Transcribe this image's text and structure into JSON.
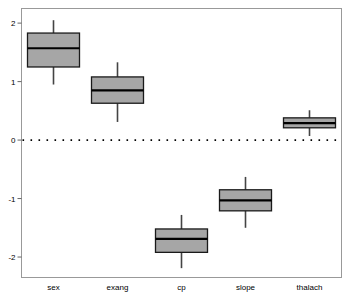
{
  "chart_data": {
    "type": "boxplot",
    "title": "",
    "subtitle": "",
    "xlabel": "",
    "ylabel": "",
    "categories": [
      "sex",
      "exang",
      "cp",
      "slope",
      "thalach"
    ],
    "ylim": [
      -2.35,
      2.25
    ],
    "yticks": [
      2,
      1,
      0,
      -1,
      -2
    ],
    "ytick_labels": [
      "2",
      "1",
      "0",
      "-1",
      "-2"
    ],
    "grid": false,
    "legend": "none",
    "reference_line": {
      "value": 0,
      "style": "dotted",
      "color": "#000000",
      "label": "0"
    },
    "box_fill": "#a6a6a6",
    "box_stroke": "#1a1a1a",
    "frame_color": "#999999",
    "boxes": [
      {
        "name": "sex",
        "whisker_low": 0.95,
        "q1": 1.25,
        "median": 1.57,
        "q3": 1.83,
        "whisker_high": 2.05
      },
      {
        "name": "exang",
        "whisker_low": 0.31,
        "q1": 0.63,
        "median": 0.85,
        "q3": 1.08,
        "whisker_high": 1.33
      },
      {
        "name": "cp",
        "whisker_low": -2.19,
        "q1": -1.92,
        "median": -1.69,
        "q3": -1.52,
        "whisker_high": -1.28
      },
      {
        "name": "slope",
        "whisker_low": -1.5,
        "q1": -1.21,
        "median": -1.03,
        "q3": -0.85,
        "whisker_high": -0.63
      },
      {
        "name": "thalach",
        "whisker_low": 0.07,
        "q1": 0.21,
        "median": 0.29,
        "q3": 0.38,
        "whisker_high": 0.51
      }
    ]
  },
  "axes": {
    "y_tick_labels": [
      "2",
      "1",
      "0",
      "-1",
      "-2"
    ],
    "x_tick_labels": [
      "sex",
      "exang",
      "cp",
      "slope",
      "thalach"
    ]
  }
}
